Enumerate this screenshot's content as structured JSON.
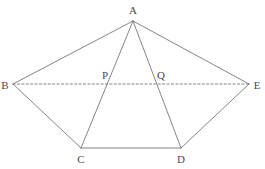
{
  "figure": {
    "type": "geometry-diagram",
    "width": 265,
    "height": 169,
    "background_color": "#ffffff",
    "stroke_color": "#777777",
    "label_color": "#4a4a4a",
    "stroke_width": 0.9,
    "dash_pattern": "2.2,2.2"
  },
  "points": {
    "A": {
      "label": "A",
      "x": 133,
      "y": 21,
      "label_x": 133,
      "label_y": 10
    },
    "B": {
      "label": "B",
      "x": 13,
      "y": 84,
      "label_x": 5,
      "label_y": 85
    },
    "C": {
      "label": "C",
      "x": 81,
      "y": 148,
      "label_x": 81,
      "label_y": 159
    },
    "D": {
      "label": "D",
      "x": 181,
      "y": 148,
      "label_x": 181,
      "label_y": 159
    },
    "E": {
      "label": "E",
      "x": 249,
      "y": 84,
      "label_x": 257,
      "label_y": 85
    },
    "P": {
      "label": "P",
      "x": 111,
      "y": 84,
      "label_x": 105,
      "label_y": 75
    },
    "Q": {
      "label": "Q",
      "x": 158,
      "y": 84,
      "label_x": 161,
      "label_y": 75
    }
  },
  "segments": [
    {
      "name": "segment-BA",
      "from": "B",
      "to": "A",
      "style": "solid"
    },
    {
      "name": "segment-AE",
      "from": "A",
      "to": "E",
      "style": "solid"
    },
    {
      "name": "segment-BC",
      "from": "B",
      "to": "C",
      "style": "solid"
    },
    {
      "name": "segment-DE",
      "from": "D",
      "to": "E",
      "style": "solid"
    },
    {
      "name": "segment-CD",
      "from": "C",
      "to": "D",
      "style": "solid"
    },
    {
      "name": "segment-AC",
      "from": "A",
      "to": "C",
      "style": "solid"
    },
    {
      "name": "segment-AD",
      "from": "A",
      "to": "D",
      "style": "solid"
    },
    {
      "name": "segment-BE",
      "from": "B",
      "to": "E",
      "style": "dashed"
    }
  ],
  "label_order": [
    "A",
    "B",
    "C",
    "D",
    "E",
    "P",
    "Q"
  ]
}
